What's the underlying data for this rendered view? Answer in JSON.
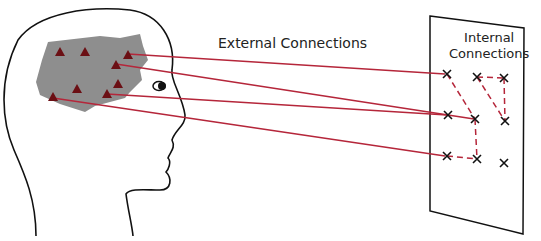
{
  "labels": {
    "external": "External Connections",
    "internal_line1": "Internal",
    "internal_line2": "Connections"
  },
  "colors": {
    "connection": "#b5263a",
    "brain": "#8e8e8e",
    "node": "#6b0f14",
    "outline": "#111111"
  },
  "brain_nodes": [
    [
      60,
      53
    ],
    [
      85,
      53
    ],
    [
      128,
      56
    ],
    [
      116,
      66
    ],
    [
      77,
      90
    ],
    [
      118,
      85
    ],
    [
      107,
      95
    ],
    [
      53,
      98
    ]
  ],
  "panel_nodes": [
    [
      447,
      74
    ],
    [
      477,
      77
    ],
    [
      504,
      78
    ],
    [
      448,
      115
    ],
    [
      475,
      119
    ],
    [
      505,
      121
    ],
    [
      447,
      156
    ],
    [
      477,
      159
    ],
    [
      504,
      163
    ]
  ]
}
